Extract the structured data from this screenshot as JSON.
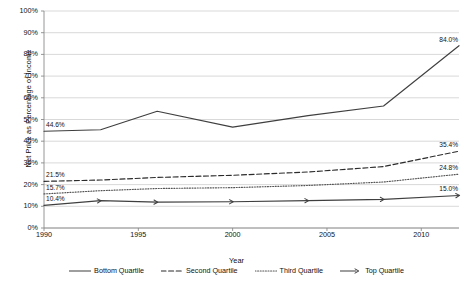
{
  "chart_data": {
    "type": "line",
    "title": "",
    "xlabel": "Year",
    "ylabel": "Net Price as Percentage of Income",
    "xlim": [
      1990,
      2012
    ],
    "ylim": [
      0,
      100
    ],
    "grid": true,
    "legend_position": "bottom",
    "yticks": [
      "0%",
      "10%",
      "20%",
      "30%",
      "40%",
      "50%",
      "60%",
      "70%",
      "80%",
      "90%",
      "100%"
    ],
    "ytick_values": [
      0,
      10,
      20,
      30,
      40,
      50,
      60,
      70,
      80,
      90,
      100
    ],
    "xticks": [
      "1990",
      "1995",
      "2000",
      "2005",
      "2010"
    ],
    "xtick_values": [
      1990,
      1995,
      2000,
      2005,
      2010
    ],
    "x": [
      1990,
      1993,
      1996,
      2000,
      2004,
      2008,
      2012
    ],
    "series": [
      {
        "name": "Bottom Quartile",
        "style": "solid",
        "marker": "none",
        "color": "#3f3f3f",
        "values": [
          44.6,
          45.3,
          53.8,
          46.5,
          51.8,
          56.2,
          84.0
        ],
        "start_label": "44.6%",
        "end_label": "84.0%"
      },
      {
        "name": "Second Quartile",
        "style": "dashed",
        "marker": "none",
        "color": "#2b2b2b",
        "values": [
          21.5,
          22.1,
          23.3,
          24.3,
          25.8,
          28.3,
          35.4
        ],
        "start_label": "21.5%",
        "end_label": "35.4%"
      },
      {
        "name": "Third Quartile",
        "style": "dotted",
        "marker": "none",
        "color": "#555555",
        "values": [
          15.7,
          17.2,
          18.2,
          18.6,
          19.6,
          21.2,
          24.8
        ],
        "start_label": "15.7%",
        "end_label": "24.8%"
      },
      {
        "name": "Top Quartile",
        "style": "solid",
        "marker": "arrow",
        "color": "#3f3f3f",
        "values": [
          10.4,
          12.6,
          11.9,
          12.1,
          12.6,
          13.2,
          15.0
        ],
        "start_label": "10.4%",
        "end_label": "15.0%"
      }
    ]
  }
}
